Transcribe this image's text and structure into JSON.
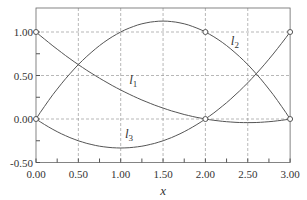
{
  "chart_data": {
    "type": "line",
    "title": "",
    "xlabel": "x",
    "ylabel": "",
    "xlim": [
      0,
      3
    ],
    "ylim": [
      -0.5,
      1.1
    ],
    "grid": true,
    "x_ticks": [
      "0.00",
      "0.50",
      "1.00",
      "1.50",
      "2.00",
      "2.50",
      "3.00"
    ],
    "y_ticks": [
      "1.00",
      "0.50",
      "0.00",
      "-0.50"
    ],
    "series": [
      {
        "name": "l1",
        "formula": "(x-2)(x-3)/6",
        "x": [
          0,
          0.5,
          1,
          1.5,
          2,
          2.5,
          3
        ],
        "values": [
          1,
          0.625,
          0.333,
          0.125,
          0,
          -0.042,
          0
        ]
      },
      {
        "name": "l2",
        "formula": "-x(x-3)/2",
        "x": [
          0,
          0.5,
          1,
          1.5,
          2,
          2.5,
          3
        ],
        "values": [
          0,
          0.625,
          1,
          1.125,
          1,
          0.625,
          0
        ]
      },
      {
        "name": "l3",
        "formula": "x(x-2)/3",
        "x": [
          0,
          0.5,
          1,
          1.5,
          2,
          2.5,
          3
        ],
        "values": [
          0,
          -0.25,
          -0.333,
          -0.25,
          0,
          0.417,
          1
        ]
      }
    ],
    "nodes": [
      [
        0,
        1
      ],
      [
        0,
        0
      ],
      [
        2,
        1
      ],
      [
        2,
        0
      ],
      [
        3,
        1
      ],
      [
        3,
        0
      ]
    ],
    "annotations": [
      {
        "text": "l1",
        "sub": "1"
      },
      {
        "text": "l2",
        "sub": "2"
      },
      {
        "text": "l3",
        "sub": "3"
      }
    ]
  }
}
